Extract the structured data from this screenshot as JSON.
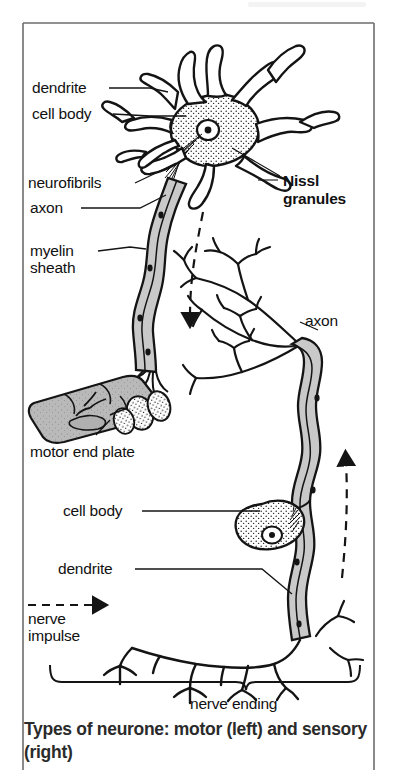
{
  "figure": {
    "caption": "Types of neurone: motor (left) and sensory (right)",
    "frame_color": "#6d6d6d",
    "ink_color": "#141414",
    "fill_color": "#c9c9c9",
    "background": "#ffffff"
  },
  "labels": {
    "dendrite_top": "dendrite",
    "cell_body_top": "cell body",
    "neurofibrils": "neurofibrils",
    "axon_left": "axon",
    "myelin_sheath_line1": "myelin",
    "myelin_sheath_line2": "sheath",
    "motor_end_plate": "motor end plate",
    "nissl_line1": "Nissl",
    "nissl_line2": "granules",
    "axon_right": "axon",
    "cell_body_bottom": "cell body",
    "dendrite_bottom": "dendrite",
    "nerve_impulse_line1": "nerve",
    "nerve_impulse_line2": "impulse",
    "nerve_ending": "nerve ending"
  },
  "legend": {
    "nerve_impulse_arrow": "dashed-arrow-icon"
  },
  "icons": {
    "nucleus": "nucleus-icon",
    "brace": "curly-brace-icon",
    "flow_arrow_motor": "dashed-arrow-down-icon",
    "flow_arrow_sensory": "dashed-arrow-up-icon"
  }
}
